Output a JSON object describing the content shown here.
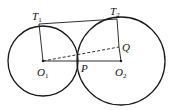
{
  "diagram": {
    "colors": {
      "stroke": "#1a1a1a",
      "background": "#ffffff"
    },
    "circles": [
      {
        "name": "O1",
        "cx": 43,
        "cy": 61,
        "r": 35
      },
      {
        "name": "O2",
        "cx": 121,
        "cy": 61,
        "r": 44
      }
    ],
    "points": {
      "T1": {
        "x": 39,
        "y": 24
      },
      "T2": {
        "x": 117,
        "y": 19
      },
      "O1": {
        "x": 43,
        "y": 61
      },
      "O2": {
        "x": 121,
        "y": 61
      },
      "P": {
        "x": 78,
        "y": 61
      },
      "Q": {
        "x": 119,
        "y": 47
      }
    },
    "segments": [
      {
        "from": "T1",
        "to": "T2",
        "style": "solid"
      },
      {
        "from": "T1",
        "to": "O1",
        "style": "solid"
      },
      {
        "from": "T2",
        "to": "Q",
        "style": "solid"
      },
      {
        "from": "Q",
        "to": "O2",
        "style": "solid"
      },
      {
        "from": "O1",
        "to": "O2",
        "style": "solid"
      },
      {
        "from": "O1",
        "to": "Q",
        "style": "dashed"
      }
    ],
    "labels": {
      "T1": {
        "main": "T",
        "sub": "1"
      },
      "T2": {
        "main": "T",
        "sub": "2"
      },
      "Q": {
        "main": "Q"
      },
      "O1": {
        "main": "O",
        "sub": "1"
      },
      "P": {
        "main": "P"
      },
      "O2": {
        "main": "O",
        "sub": "2"
      }
    }
  }
}
